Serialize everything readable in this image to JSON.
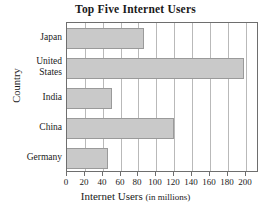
{
  "chart_data": {
    "type": "bar",
    "orientation": "horizontal",
    "title": "Top Five Internet Users",
    "xlabel": "Internet Users",
    "xlabel_units": "(in millions)",
    "ylabel": "Country",
    "categories": [
      "Japan",
      "United States",
      "India",
      "China",
      "Germany"
    ],
    "values": [
      86,
      198,
      50,
      120,
      46
    ],
    "xlim": [
      0,
      215
    ],
    "xticks": [
      0,
      20,
      40,
      60,
      80,
      100,
      120,
      140,
      160,
      180,
      200
    ],
    "xtick_labels": [
      "0",
      "20",
      "40",
      "60",
      "80",
      "100",
      "120",
      "140",
      "160",
      "180",
      "200"
    ],
    "grid": "vertical",
    "legend": "none",
    "bar_color": "#c9c9c9",
    "bar_edge_color": "#9a9a9a",
    "grid_color": "#b9b9b9",
    "frame_color": "#6e6e6e",
    "background_color": "#ffffff"
  }
}
